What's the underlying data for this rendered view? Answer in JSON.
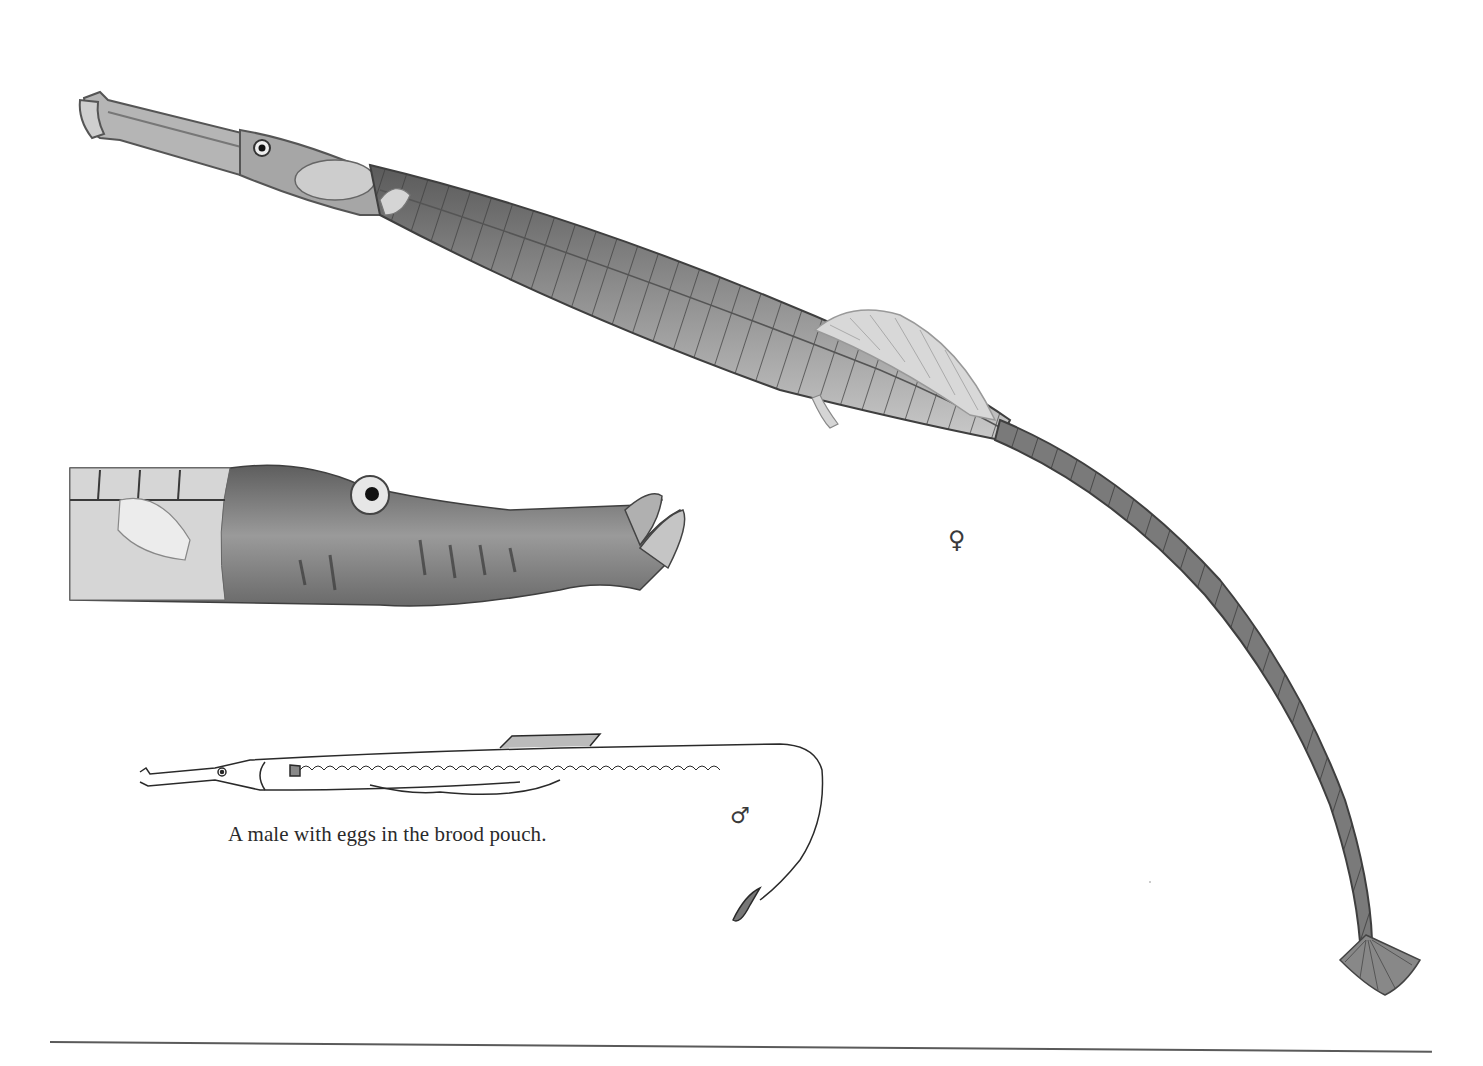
{
  "plate": {
    "subject": "pipefish illustration plate",
    "figures": [
      {
        "id": "female",
        "description": "large female pipefish, full body, shaded",
        "symbol": "♀"
      },
      {
        "id": "head-detail",
        "description": "enlarged head of pipefish"
      },
      {
        "id": "male",
        "description": "line drawing of male with brood pouch",
        "symbol": "♂"
      }
    ],
    "caption": "A male with eggs in the brood pouch.",
    "female_symbol": "♀",
    "male_symbol": "♂"
  },
  "colors": {
    "background": "#ffffff",
    "ink": "#2a2a2a",
    "body_dark": "#4a4a4a",
    "body_mid": "#8a8a8a",
    "body_light": "#c8c8c8",
    "rule": "#5a5a5a"
  }
}
